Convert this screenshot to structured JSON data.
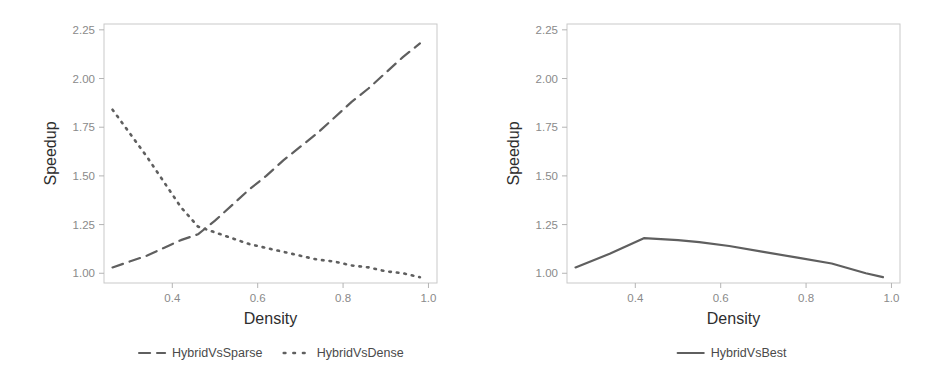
{
  "figure": {
    "background": "#ffffff",
    "line_color": "#5f5f5f",
    "axis_color": "#c9c9c9",
    "tick_text_color": "#8a8a8a",
    "title_text_color": "#2e2e2e"
  },
  "chart_data": [
    {
      "panel": "left",
      "type": "line",
      "title": "",
      "xlabel": "Density",
      "ylabel": "Speedup",
      "xlim": [
        0.24,
        1.02
      ],
      "ylim": [
        0.95,
        2.28
      ],
      "xticks": [
        0.4,
        0.6,
        0.8,
        1.0
      ],
      "xticklabels": [
        "0.4",
        "0.6",
        "0.8",
        "1.0"
      ],
      "yticks": [
        1.0,
        1.25,
        1.5,
        1.75,
        2.0,
        2.25
      ],
      "yticklabels": [
        "1.00",
        "1.25",
        "1.50",
        "1.75",
        "2.00",
        "2.25"
      ],
      "grid": false,
      "legend_position": "below",
      "series": [
        {
          "name": "HybridVsSparse",
          "style": "dashed",
          "color": "#5f5f5f",
          "x": [
            0.26,
            0.3,
            0.34,
            0.38,
            0.42,
            0.46,
            0.5,
            0.54,
            0.58,
            0.62,
            0.66,
            0.7,
            0.74,
            0.78,
            0.82,
            0.86,
            0.9,
            0.94,
            0.98
          ],
          "y": [
            1.03,
            1.06,
            1.09,
            1.13,
            1.17,
            1.2,
            1.27,
            1.35,
            1.43,
            1.5,
            1.58,
            1.65,
            1.72,
            1.8,
            1.88,
            1.95,
            2.03,
            2.11,
            2.18
          ]
        },
        {
          "name": "HybridVsDense",
          "style": "dotted",
          "color": "#5f5f5f",
          "x": [
            0.26,
            0.3,
            0.34,
            0.38,
            0.42,
            0.46,
            0.5,
            0.54,
            0.58,
            0.62,
            0.66,
            0.7,
            0.74,
            0.78,
            0.82,
            0.86,
            0.9,
            0.94,
            0.98
          ],
          "y": [
            1.84,
            1.72,
            1.6,
            1.47,
            1.34,
            1.24,
            1.21,
            1.18,
            1.15,
            1.13,
            1.11,
            1.09,
            1.07,
            1.06,
            1.04,
            1.03,
            1.01,
            1.0,
            0.98
          ]
        }
      ]
    },
    {
      "panel": "right",
      "type": "line",
      "title": "",
      "xlabel": "Density",
      "ylabel": "Speedup",
      "xlim": [
        0.24,
        1.02
      ],
      "ylim": [
        0.95,
        2.28
      ],
      "xticks": [
        0.4,
        0.6,
        0.8,
        1.0
      ],
      "xticklabels": [
        "0.4",
        "0.6",
        "0.8",
        "1.0"
      ],
      "yticks": [
        1.0,
        1.25,
        1.5,
        1.75,
        2.0,
        2.25
      ],
      "yticklabels": [
        "1.00",
        "1.25",
        "1.50",
        "1.75",
        "2.00",
        "2.25"
      ],
      "grid": false,
      "legend_position": "below",
      "series": [
        {
          "name": "HybridVsBest",
          "style": "solid",
          "color": "#5f5f5f",
          "x": [
            0.26,
            0.34,
            0.42,
            0.5,
            0.55,
            0.62,
            0.7,
            0.78,
            0.86,
            0.94,
            0.98
          ],
          "y": [
            1.03,
            1.1,
            1.18,
            1.17,
            1.16,
            1.14,
            1.11,
            1.08,
            1.05,
            1.0,
            0.98
          ]
        }
      ]
    }
  ],
  "left_panel": {
    "name": "speedup-vs-density-left",
    "axis": {
      "x_title": "Density",
      "y_title": "Speedup",
      "x_ticks": [
        "0.4",
        "0.6",
        "0.8",
        "1.0"
      ],
      "y_ticks": [
        "1.00",
        "1.25",
        "1.50",
        "1.75",
        "2.00",
        "2.25"
      ]
    },
    "legend": {
      "entries": [
        {
          "label": "HybridVsSparse",
          "style": "dashed"
        },
        {
          "label": "HybridVsDense",
          "style": "dotted"
        }
      ]
    }
  },
  "right_panel": {
    "name": "speedup-vs-density-right",
    "axis": {
      "x_title": "Density",
      "y_title": "Speedup",
      "x_ticks": [
        "0.4",
        "0.6",
        "0.8",
        "1.0"
      ],
      "y_ticks": [
        "1.00",
        "1.25",
        "1.50",
        "1.75",
        "2.00",
        "2.25"
      ]
    },
    "legend": {
      "entries": [
        {
          "label": "HybridVsBest",
          "style": "solid"
        }
      ]
    }
  }
}
